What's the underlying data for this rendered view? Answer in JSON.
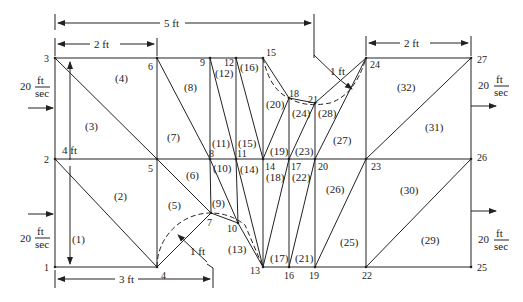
{
  "diagram": {
    "nodes": [
      {
        "id": "1",
        "x": 55,
        "y": 267,
        "lx": 44,
        "ly": 271
      },
      {
        "id": "2",
        "x": 55,
        "y": 159,
        "lx": 44,
        "ly": 163
      },
      {
        "id": "3",
        "x": 55,
        "y": 58,
        "lx": 44,
        "ly": 62
      },
      {
        "id": "4",
        "x": 157,
        "y": 267,
        "lx": 161,
        "ly": 279
      },
      {
        "id": "5",
        "x": 157,
        "y": 159,
        "lx": 148,
        "ly": 172
      },
      {
        "id": "6",
        "x": 157,
        "y": 58,
        "lx": 148,
        "ly": 70
      },
      {
        "id": "7",
        "x": 211,
        "y": 213,
        "lx": 207,
        "ly": 226
      },
      {
        "id": "8",
        "x": 210,
        "y": 159,
        "lx": 209,
        "ly": 157
      },
      {
        "id": "9",
        "x": 210,
        "y": 58,
        "lx": 200,
        "ly": 66
      },
      {
        "id": "10",
        "x": 238,
        "y": 223,
        "lx": 227,
        "ly": 232
      },
      {
        "id": "11",
        "x": 236,
        "y": 159,
        "lx": 237,
        "ly": 157
      },
      {
        "id": "12",
        "x": 236,
        "y": 58,
        "lx": 224,
        "ly": 66
      },
      {
        "id": "13",
        "x": 263,
        "y": 267,
        "lx": 250,
        "ly": 274
      },
      {
        "id": "14",
        "x": 263,
        "y": 159,
        "lx": 265,
        "ly": 170
      },
      {
        "id": "15",
        "x": 263,
        "y": 58,
        "lx": 266,
        "ly": 56
      },
      {
        "id": "16",
        "x": 289,
        "y": 267,
        "lx": 284,
        "ly": 279
      },
      {
        "id": "17",
        "x": 289,
        "y": 159,
        "lx": 291,
        "ly": 170
      },
      {
        "id": "18",
        "x": 289,
        "y": 98,
        "lx": 289,
        "ly": 97
      },
      {
        "id": "19",
        "x": 315,
        "y": 267,
        "lx": 309,
        "ly": 279
      },
      {
        "id": "20",
        "x": 315,
        "y": 159,
        "lx": 318,
        "ly": 170
      },
      {
        "id": "21",
        "x": 315,
        "y": 103,
        "lx": 308,
        "ly": 103
      },
      {
        "id": "22",
        "x": 366,
        "y": 267,
        "lx": 362,
        "ly": 279
      },
      {
        "id": "23",
        "x": 366,
        "y": 159,
        "lx": 371,
        "ly": 170
      },
      {
        "id": "24",
        "x": 366,
        "y": 58,
        "lx": 370,
        "ly": 68
      },
      {
        "id": "25",
        "x": 471,
        "y": 267,
        "lx": 477,
        "ly": 271
      },
      {
        "id": "26",
        "x": 471,
        "y": 159,
        "lx": 477,
        "ly": 161
      },
      {
        "id": "27",
        "x": 471,
        "y": 58,
        "lx": 477,
        "ly": 63
      }
    ],
    "edges": [
      [
        "1",
        "2"
      ],
      [
        "2",
        "3"
      ],
      [
        "1",
        "4"
      ],
      [
        "2",
        "5"
      ],
      [
        "3",
        "6"
      ],
      [
        "4",
        "5"
      ],
      [
        "5",
        "6"
      ],
      [
        "2",
        "4"
      ],
      [
        "3",
        "5"
      ],
      [
        "6",
        "9"
      ],
      [
        "9",
        "12"
      ],
      [
        "12",
        "15"
      ],
      [
        "6",
        "8"
      ],
      [
        "5",
        "8"
      ],
      [
        "8",
        "11"
      ],
      [
        "11",
        "14"
      ],
      [
        "9",
        "8"
      ],
      [
        "12",
        "11"
      ],
      [
        "15",
        "14"
      ],
      [
        "9",
        "11"
      ],
      [
        "12",
        "14"
      ],
      [
        "4",
        "7"
      ],
      [
        "5",
        "7"
      ],
      [
        "7",
        "8"
      ],
      [
        "7",
        "10"
      ],
      [
        "8",
        "10"
      ],
      [
        "10",
        "11"
      ],
      [
        "10",
        "13"
      ],
      [
        "11",
        "13"
      ],
      [
        "14",
        "13"
      ],
      [
        "13",
        "16"
      ],
      [
        "16",
        "19"
      ],
      [
        "19",
        "22"
      ],
      [
        "22",
        "25"
      ],
      [
        "13",
        "17"
      ],
      [
        "16",
        "17"
      ],
      [
        "14",
        "17"
      ],
      [
        "17",
        "20"
      ],
      [
        "20",
        "23"
      ],
      [
        "23",
        "26"
      ],
      [
        "19",
        "20"
      ],
      [
        "16",
        "20"
      ],
      [
        "19",
        "23"
      ],
      [
        "22",
        "23"
      ],
      [
        "25",
        "26"
      ],
      [
        "22",
        "26"
      ],
      [
        "23",
        "24"
      ],
      [
        "26",
        "27"
      ],
      [
        "24",
        "27"
      ],
      [
        "23",
        "27"
      ],
      [
        "15",
        "18"
      ],
      [
        "18",
        "21"
      ],
      [
        "21",
        "24"
      ],
      [
        "14",
        "18"
      ],
      [
        "17",
        "18"
      ],
      [
        "17",
        "21"
      ],
      [
        "20",
        "21"
      ],
      [
        "20",
        "24"
      ]
    ],
    "elements": [
      {
        "label": "(1)",
        "x": 72,
        "y": 243
      },
      {
        "label": "(2)",
        "x": 114,
        "y": 200
      },
      {
        "label": "(3)",
        "x": 85,
        "y": 130
      },
      {
        "label": "(4)",
        "x": 115,
        "y": 82
      },
      {
        "label": "(5)",
        "x": 168,
        "y": 209
      },
      {
        "label": "(6)",
        "x": 186,
        "y": 179
      },
      {
        "label": "(7)",
        "x": 167,
        "y": 141
      },
      {
        "label": "(8)",
        "x": 184,
        "y": 91
      },
      {
        "label": "(9)",
        "x": 212,
        "y": 207
      },
      {
        "label": "(10)",
        "x": 213,
        "y": 172
      },
      {
        "label": "(11)",
        "x": 212,
        "y": 147
      },
      {
        "label": "(12)",
        "x": 215,
        "y": 77
      },
      {
        "label": "(13)",
        "x": 228,
        "y": 253
      },
      {
        "label": "(14)",
        "x": 240,
        "y": 173
      },
      {
        "label": "(15)",
        "x": 238,
        "y": 147
      },
      {
        "label": "(16)",
        "x": 240,
        "y": 71
      },
      {
        "label": "(17)",
        "x": 270,
        "y": 262
      },
      {
        "label": "(18)",
        "x": 266,
        "y": 181
      },
      {
        "label": "(19)",
        "x": 270,
        "y": 155
      },
      {
        "label": "(20)",
        "x": 266,
        "y": 108
      },
      {
        "label": "(21)",
        "x": 295,
        "y": 262
      },
      {
        "label": "(22)",
        "x": 292,
        "y": 181
      },
      {
        "label": "(23)",
        "x": 295,
        "y": 155
      },
      {
        "label": "(24)",
        "x": 292,
        "y": 117
      },
      {
        "label": "(25)",
        "x": 340,
        "y": 246
      },
      {
        "label": "(26)",
        "x": 326,
        "y": 193
      },
      {
        "label": "(27)",
        "x": 333,
        "y": 144
      },
      {
        "label": "(28)",
        "x": 318,
        "y": 117
      },
      {
        "label": "(29)",
        "x": 421,
        "y": 244
      },
      {
        "label": "(30)",
        "x": 400,
        "y": 194
      },
      {
        "label": "(31)",
        "x": 425,
        "y": 131
      },
      {
        "label": "(32)",
        "x": 397,
        "y": 91
      }
    ],
    "dimensions": {
      "top_5ft": "5 ft",
      "top_2ft_left": "2 ft",
      "top_2ft_right": "2 ft",
      "left_4ft": "4 ft",
      "bottom_3ft": "3 ft",
      "radius_left": "1 ft",
      "radius_right": "1 ft"
    },
    "velocity": {
      "value": "20",
      "unit_num": "ft",
      "unit_den": "sec"
    }
  }
}
